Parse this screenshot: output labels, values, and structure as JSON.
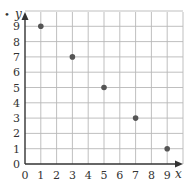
{
  "chart_data": {
    "type": "scatter",
    "title": "",
    "xlabel": "x",
    "ylabel": "y",
    "xlim": [
      0,
      10
    ],
    "ylim": [
      0,
      10
    ],
    "grid": true,
    "x_ticks": [
      "0",
      "1",
      "2",
      "3",
      "4",
      "5",
      "6",
      "7",
      "8",
      "9"
    ],
    "y_ticks": [
      "0",
      "1",
      "2",
      "3",
      "4",
      "5",
      "6",
      "7",
      "8",
      "9"
    ],
    "series": [
      {
        "name": "points",
        "points": [
          {
            "x": 1,
            "y": 9
          },
          {
            "x": 3,
            "y": 7
          },
          {
            "x": 5,
            "y": 5
          },
          {
            "x": 7,
            "y": 3
          },
          {
            "x": 9,
            "y": 1
          }
        ]
      }
    ],
    "colors": {
      "point": "#555555",
      "grid": "#b8b8b8",
      "axis": "#333333"
    }
  },
  "marker": "•"
}
